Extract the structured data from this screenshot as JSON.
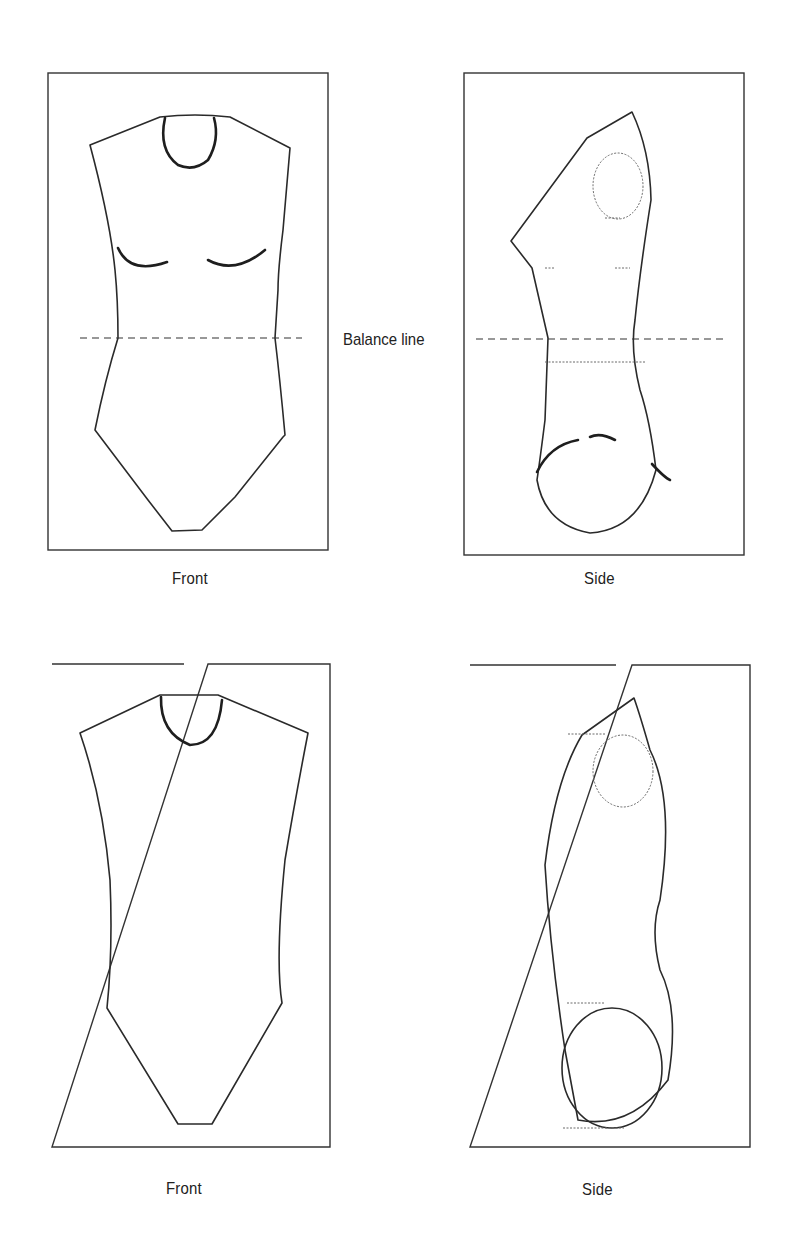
{
  "figure": {
    "balance_line_label": "Balance line",
    "panels": [
      {
        "id": "top-front",
        "caption": "Front",
        "view": "front",
        "row": 1,
        "shows_balance_line": true
      },
      {
        "id": "top-side",
        "caption": "Side",
        "view": "side",
        "row": 1,
        "shows_balance_line": true
      },
      {
        "id": "bottom-front",
        "caption": "Front",
        "view": "front",
        "row": 2,
        "shows_balance_line": false
      },
      {
        "id": "bottom-side",
        "caption": "Side",
        "view": "side",
        "row": 2,
        "shows_balance_line": false
      }
    ]
  },
  "colors": {
    "background": "#ffffff",
    "ink": "#222222"
  }
}
